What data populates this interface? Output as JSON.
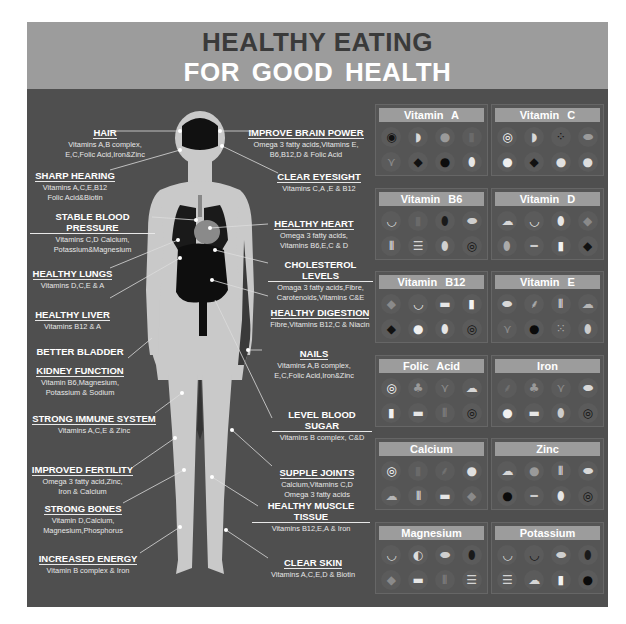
{
  "header": {
    "title_line1": "HEALTHY EATING",
    "title_line2": "FOR  GOOD HEALTH"
  },
  "colors": {
    "header_bg": "#9c9c9c",
    "panel_bg": "#4f4f4f",
    "title_dark": "#3a3a3a",
    "title_light": "#ffffff",
    "body_figure": "#c9c9c9",
    "organs": "#111111"
  },
  "left_labels": [
    {
      "title": "HAIR",
      "text": "Vitamins A,B complex,\nE,C,Folic Acid,Iron&Zinc"
    },
    {
      "title": "SHARP HEARING",
      "text": "Vitamins A,C,E,B12\nFolic Acid&Biotin"
    },
    {
      "title": "STABLE BLOOD PRESSURE",
      "text": "Vitamins C,D Calcium,\nPotassium&Magnesium"
    },
    {
      "title": "HEALTHY LUNGS",
      "text": "Vitamins D,C,E & A"
    },
    {
      "title": "HEALTHY LIVER",
      "text": "Vitamins B12 & A"
    },
    {
      "title": "BETTER BLADDER",
      "title2": "KIDNEY FUNCTION",
      "text": "Vitamin B6,Magnesium,\nPotassium & Sodium"
    },
    {
      "title": "STRONG IMMUNE SYSTEM",
      "text": "Vitamins A,C,E & Zinc"
    },
    {
      "title": "IMPROVED FERTILITY",
      "text": "Omega 3 fatty acid,Zinc,\nIron & Calcium"
    },
    {
      "title": "STRONG BONES",
      "text": "Vitamin D,Calcium,\nMagnesium,Phosphorus"
    },
    {
      "title": "INCREASED ENERGY",
      "text": "Vitamin B complex & Iron"
    }
  ],
  "right_labels": [
    {
      "title": "IMPROVE BRAIN POWER",
      "text": "Omega 3 fatty acids,Vitamins E,\nB6,B12,D & Folic Acid"
    },
    {
      "title": "CLEAR EYESIGHT",
      "text": "Vitamins C,A ,E & B12"
    },
    {
      "title": "HEALTHY HEART",
      "text": "Omega 3 fatty acids,\nVitamins B6,E,C & D"
    },
    {
      "title": "CHOLESTEROL LEVELS",
      "text": "Omaga 3 fatty acids,Fibre,\nCarotenoids,Vitamins C&E"
    },
    {
      "title": "HEALTHY DIGESTION",
      "text": "Fibre,Vitamins B12,C & Niacin"
    },
    {
      "title": "NAILS",
      "text": "Vitamins A,B complex,\nE,C,Folic Acid,Iron&Zinc"
    },
    {
      "title": "LEVEL BLOOD SUGAR",
      "text": "Vitamins B complex, C&D"
    },
    {
      "title": "SUPPLE JOINTS",
      "text": "Calcium,Vitamins C,D\nOmega 3 fatty acids"
    },
    {
      "title": "HEALTHY MUSCLE TISSUE",
      "text": "Vitamins B12,E,A & Iron"
    },
    {
      "title": "CLEAR SKIN",
      "text": "Vitamins A,C,E,D & Biotin"
    }
  ],
  "nutrients": [
    {
      "name": "Vitamin  A",
      "icons": [
        "sushi-roll-icon",
        "melon-slices-icon",
        "pumpkin-icon",
        "carrots-icon",
        "asparagus-icon",
        "liver-icon",
        "kidney-bean-icon",
        "egg-icon"
      ]
    },
    {
      "name": "Vitamin  C",
      "icons": [
        "orange-slice-icon",
        "melon-slices-icon",
        "berries-icon",
        "papaya-icon",
        "cauliflower-icon",
        "liver-icon",
        "cauliflower-head-icon",
        "onion-icon"
      ]
    },
    {
      "name": "Vitamin  B6",
      "icons": [
        "banana-icon",
        "carrots-icon",
        "avocado-icon",
        "sausage-icon",
        "seeds-icon",
        "sandwich-icon",
        "eggs-plate-icon",
        "spiral-icon"
      ]
    },
    {
      "name": "Vitamin  D",
      "icons": [
        "mushrooms-icon",
        "fish-dish-icon",
        "egg-icon",
        "meat-icon",
        "almonds-icon",
        "fish-icon",
        "milk-bottle-icon",
        "liver-icon"
      ]
    },
    {
      "name": "Vitamin  B12",
      "icons": [
        "meat-icon",
        "fish-dish-icon",
        "cheese-icon",
        "milk-bottle-icon",
        "liver-icon",
        "yogurt-icon",
        "egg-icon",
        "spiral-icon"
      ]
    },
    {
      "name": "Vitamin  E",
      "icons": [
        "bean-icon",
        "herb-icon",
        "seeds-icon",
        "nut-icon",
        "asparagus-icon",
        "olive-oil-icon",
        "seeds-mix-icon",
        "oil-jar-icon"
      ]
    },
    {
      "name": "Folic Acid",
      "icons": [
        "orange-slice-icon",
        "broccoli-icon",
        "asparagus-icon",
        "mushrooms-icon",
        "milk-bottle-icon",
        "cheese-icon",
        "asparagus-bunch-icon",
        "spiral-icon"
      ]
    },
    {
      "name": "Iron",
      "icons": [
        "spinach-icon",
        "broccoli-icon",
        "asparagus-icon",
        "bean-icon",
        "yogurt-icon",
        "cheese-icon",
        "drumstick-icon",
        "spiral-icon"
      ]
    },
    {
      "name": "Calcium",
      "icons": [
        "orange-slice-icon",
        "carrots-icon",
        "spinach-icon",
        "cauliflower-head-icon",
        "nut-icon",
        "seeds-icon",
        "cheese-icon",
        "meat-icon"
      ]
    },
    {
      "name": "Zinc",
      "icons": [
        "mushrooms-icon",
        "pumpkin-icon",
        "seeds-icon",
        "bean-icon",
        "olive-oil-icon",
        "fish-icon",
        "egg-icon",
        "spiral-icon"
      ]
    },
    {
      "name": "Magnesium",
      "icons": [
        "banana-icon",
        "kiwi-icon",
        "sausage-icon",
        "avocado-icon",
        "meat-icon",
        "cheese-icon",
        "asparagus-bunch-icon",
        "sandwich-icon"
      ]
    },
    {
      "name": "Potassium",
      "icons": [
        "banana-icon",
        "watermelon-icon",
        "sausage-icon",
        "avocado-icon",
        "sandwich-icon",
        "mushrooms-icon",
        "milk-bottle-icon",
        "dark-fruit-icon"
      ]
    }
  ]
}
